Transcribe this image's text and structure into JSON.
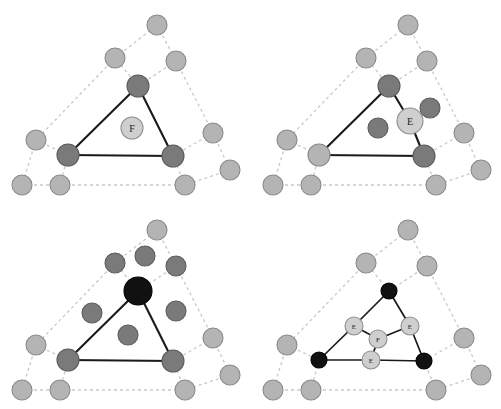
{
  "figure": {
    "width": 501,
    "height": 409,
    "background": "#ffffff"
  },
  "colors": {
    "node_light": "#b4b4b4",
    "node_mid": "#8d8d8d",
    "node_dark": "#7a7a7a",
    "node_black": "#111111",
    "node_label_fill": "#cfcfcf",
    "edge_solid": "#1a1a1a",
    "edge_dashed": "#c9c9c9"
  },
  "labels": {
    "face_point": "F",
    "edge_point": "E"
  },
  "panels": [
    {
      "id": "panel-top-left",
      "name": "face-point-panel",
      "origin": {
        "x": 0,
        "y": 0
      },
      "size": {
        "w": 250,
        "h": 205
      },
      "caption": "",
      "dashed_edges": [
        [
          115,
          58,
          157,
          25
        ],
        [
          157,
          25,
          176,
          61
        ],
        [
          176,
          61,
          138,
          86
        ],
        [
          138,
          86,
          115,
          58
        ],
        [
          115,
          58,
          36,
          140
        ],
        [
          36,
          140,
          22,
          185
        ],
        [
          36,
          140,
          68,
          155
        ],
        [
          68,
          155,
          60,
          185
        ],
        [
          22,
          185,
          60,
          185
        ],
        [
          60,
          185,
          185,
          185
        ],
        [
          185,
          185,
          173,
          156
        ],
        [
          173,
          156,
          213,
          133
        ],
        [
          213,
          133,
          176,
          61
        ],
        [
          213,
          133,
          230,
          170
        ],
        [
          230,
          170,
          185,
          185
        ]
      ],
      "solid_edges": [
        [
          138,
          86,
          68,
          155
        ],
        [
          68,
          155,
          173,
          156
        ],
        [
          173,
          156,
          138,
          86
        ]
      ],
      "nodes": [
        {
          "x": 157,
          "y": 25,
          "r": 10,
          "tone": "light",
          "label": ""
        },
        {
          "x": 115,
          "y": 58,
          "r": 10,
          "tone": "light",
          "label": ""
        },
        {
          "x": 176,
          "y": 61,
          "r": 10,
          "tone": "light",
          "label": ""
        },
        {
          "x": 138,
          "y": 86,
          "r": 11,
          "tone": "dark",
          "label": ""
        },
        {
          "x": 36,
          "y": 140,
          "r": 10,
          "tone": "light",
          "label": ""
        },
        {
          "x": 213,
          "y": 133,
          "r": 10,
          "tone": "light",
          "label": ""
        },
        {
          "x": 68,
          "y": 155,
          "r": 11,
          "tone": "dark",
          "label": ""
        },
        {
          "x": 173,
          "y": 156,
          "r": 11,
          "tone": "dark",
          "label": ""
        },
        {
          "x": 230,
          "y": 170,
          "r": 10,
          "tone": "light",
          "label": ""
        },
        {
          "x": 22,
          "y": 185,
          "r": 10,
          "tone": "light",
          "label": ""
        },
        {
          "x": 60,
          "y": 185,
          "r": 10,
          "tone": "light",
          "label": ""
        },
        {
          "x": 185,
          "y": 185,
          "r": 10,
          "tone": "light",
          "label": ""
        }
      ],
      "label_nodes": [
        {
          "x": 132,
          "y": 128,
          "r": 11,
          "label": "F",
          "size": "big"
        }
      ]
    },
    {
      "id": "panel-top-right",
      "name": "edge-point-panel",
      "origin": {
        "x": 251,
        "y": 0
      },
      "size": {
        "w": 250,
        "h": 205
      },
      "caption": "",
      "dashed_edges": [
        [
          115,
          58,
          157,
          25
        ],
        [
          157,
          25,
          176,
          61
        ],
        [
          176,
          61,
          138,
          86
        ],
        [
          138,
          86,
          115,
          58
        ],
        [
          115,
          58,
          36,
          140
        ],
        [
          36,
          140,
          22,
          185
        ],
        [
          36,
          140,
          68,
          155
        ],
        [
          68,
          155,
          60,
          185
        ],
        [
          22,
          185,
          60,
          185
        ],
        [
          60,
          185,
          185,
          185
        ],
        [
          185,
          185,
          173,
          156
        ],
        [
          173,
          156,
          213,
          133
        ],
        [
          213,
          133,
          176,
          61
        ],
        [
          213,
          133,
          230,
          170
        ],
        [
          230,
          170,
          185,
          185
        ]
      ],
      "solid_edges": [
        [
          138,
          86,
          68,
          155
        ],
        [
          68,
          155,
          173,
          156
        ],
        [
          138,
          86,
          159,
          121
        ],
        [
          159,
          121,
          173,
          156
        ]
      ],
      "nodes": [
        {
          "x": 157,
          "y": 25,
          "r": 10,
          "tone": "light",
          "label": ""
        },
        {
          "x": 115,
          "y": 58,
          "r": 10,
          "tone": "light",
          "label": ""
        },
        {
          "x": 176,
          "y": 61,
          "r": 10,
          "tone": "light",
          "label": ""
        },
        {
          "x": 138,
          "y": 86,
          "r": 11,
          "tone": "dark",
          "label": ""
        },
        {
          "x": 36,
          "y": 140,
          "r": 10,
          "tone": "light",
          "label": ""
        },
        {
          "x": 213,
          "y": 133,
          "r": 10,
          "tone": "light",
          "label": ""
        },
        {
          "x": 179,
          "y": 108,
          "r": 10,
          "tone": "dark",
          "label": ""
        },
        {
          "x": 127,
          "y": 128,
          "r": 10,
          "tone": "dark",
          "label": ""
        },
        {
          "x": 68,
          "y": 155,
          "r": 11,
          "tone": "light",
          "label": ""
        },
        {
          "x": 173,
          "y": 156,
          "r": 11,
          "tone": "dark",
          "label": ""
        },
        {
          "x": 230,
          "y": 170,
          "r": 10,
          "tone": "light",
          "label": ""
        },
        {
          "x": 22,
          "y": 185,
          "r": 10,
          "tone": "light",
          "label": ""
        },
        {
          "x": 60,
          "y": 185,
          "r": 10,
          "tone": "light",
          "label": ""
        },
        {
          "x": 185,
          "y": 185,
          "r": 10,
          "tone": "light",
          "label": ""
        }
      ],
      "label_nodes": [
        {
          "x": 159,
          "y": 121,
          "r": 13,
          "label": "E",
          "size": "big"
        }
      ]
    },
    {
      "id": "panel-bottom-left",
      "name": "vertex-point-panel",
      "origin": {
        "x": 0,
        "y": 205
      },
      "size": {
        "w": 250,
        "h": 204
      },
      "caption": "",
      "dashed_edges": [
        [
          115,
          58,
          157,
          25
        ],
        [
          157,
          25,
          176,
          61
        ],
        [
          176,
          61,
          138,
          86
        ],
        [
          138,
          86,
          115,
          58
        ],
        [
          115,
          58,
          36,
          140
        ],
        [
          36,
          140,
          22,
          185
        ],
        [
          36,
          140,
          68,
          155
        ],
        [
          68,
          155,
          60,
          185
        ],
        [
          22,
          185,
          60,
          185
        ],
        [
          60,
          185,
          185,
          185
        ],
        [
          185,
          185,
          173,
          156
        ],
        [
          173,
          156,
          213,
          133
        ],
        [
          213,
          133,
          176,
          61
        ],
        [
          213,
          133,
          230,
          170
        ],
        [
          230,
          170,
          185,
          185
        ]
      ],
      "solid_edges": [
        [
          138,
          86,
          68,
          155
        ],
        [
          68,
          155,
          173,
          156
        ],
        [
          173,
          156,
          138,
          86
        ]
      ],
      "nodes": [
        {
          "x": 157,
          "y": 25,
          "r": 10,
          "tone": "light",
          "label": ""
        },
        {
          "x": 115,
          "y": 58,
          "r": 10,
          "tone": "dark",
          "label": ""
        },
        {
          "x": 145,
          "y": 51,
          "r": 10,
          "tone": "dark",
          "label": ""
        },
        {
          "x": 176,
          "y": 61,
          "r": 10,
          "tone": "dark",
          "label": ""
        },
        {
          "x": 138,
          "y": 86,
          "r": 14,
          "tone": "black",
          "label": ""
        },
        {
          "x": 36,
          "y": 140,
          "r": 10,
          "tone": "light",
          "label": ""
        },
        {
          "x": 92,
          "y": 108,
          "r": 10,
          "tone": "dark",
          "label": ""
        },
        {
          "x": 176,
          "y": 106,
          "r": 10,
          "tone": "dark",
          "label": ""
        },
        {
          "x": 128,
          "y": 130,
          "r": 10,
          "tone": "dark",
          "label": ""
        },
        {
          "x": 213,
          "y": 133,
          "r": 10,
          "tone": "light",
          "label": ""
        },
        {
          "x": 68,
          "y": 155,
          "r": 11,
          "tone": "dark",
          "label": ""
        },
        {
          "x": 173,
          "y": 156,
          "r": 11,
          "tone": "dark",
          "label": ""
        },
        {
          "x": 230,
          "y": 170,
          "r": 10,
          "tone": "light",
          "label": ""
        },
        {
          "x": 22,
          "y": 185,
          "r": 10,
          "tone": "light",
          "label": ""
        },
        {
          "x": 60,
          "y": 185,
          "r": 10,
          "tone": "light",
          "label": ""
        },
        {
          "x": 185,
          "y": 185,
          "r": 10,
          "tone": "light",
          "label": ""
        }
      ],
      "label_nodes": []
    },
    {
      "id": "panel-bottom-right",
      "name": "subdivided-mesh-panel",
      "origin": {
        "x": 251,
        "y": 205
      },
      "size": {
        "w": 250,
        "h": 204
      },
      "caption": "",
      "dashed_edges": [
        [
          115,
          58,
          157,
          25
        ],
        [
          157,
          25,
          176,
          61
        ],
        [
          176,
          61,
          138,
          86
        ],
        [
          138,
          86,
          115,
          58
        ],
        [
          115,
          58,
          36,
          140
        ],
        [
          36,
          140,
          22,
          185
        ],
        [
          36,
          140,
          68,
          155
        ],
        [
          68,
          155,
          60,
          185
        ],
        [
          22,
          185,
          60,
          185
        ],
        [
          60,
          185,
          185,
          185
        ],
        [
          185,
          185,
          173,
          156
        ],
        [
          173,
          156,
          213,
          133
        ],
        [
          213,
          133,
          176,
          61
        ],
        [
          213,
          133,
          230,
          170
        ],
        [
          230,
          170,
          185,
          185
        ]
      ],
      "solid_edges": [
        [
          138,
          86,
          103,
          121
        ],
        [
          103,
          121,
          68,
          155
        ],
        [
          68,
          155,
          120,
          155
        ],
        [
          120,
          155,
          173,
          156
        ],
        [
          173,
          156,
          159,
          121
        ],
        [
          159,
          121,
          138,
          86
        ],
        [
          103,
          121,
          127,
          134
        ],
        [
          127,
          134,
          159,
          121
        ],
        [
          127,
          134,
          120,
          155
        ]
      ],
      "nodes": [
        {
          "x": 157,
          "y": 25,
          "r": 10,
          "tone": "light",
          "label": ""
        },
        {
          "x": 115,
          "y": 58,
          "r": 10,
          "tone": "light",
          "label": ""
        },
        {
          "x": 176,
          "y": 61,
          "r": 10,
          "tone": "light",
          "label": ""
        },
        {
          "x": 138,
          "y": 86,
          "r": 8,
          "tone": "black",
          "label": ""
        },
        {
          "x": 36,
          "y": 140,
          "r": 10,
          "tone": "light",
          "label": ""
        },
        {
          "x": 213,
          "y": 133,
          "r": 10,
          "tone": "light",
          "label": ""
        },
        {
          "x": 68,
          "y": 155,
          "r": 8,
          "tone": "black",
          "label": ""
        },
        {
          "x": 173,
          "y": 156,
          "r": 8,
          "tone": "black",
          "label": ""
        },
        {
          "x": 230,
          "y": 170,
          "r": 10,
          "tone": "light",
          "label": ""
        },
        {
          "x": 22,
          "y": 185,
          "r": 10,
          "tone": "light",
          "label": ""
        },
        {
          "x": 60,
          "y": 185,
          "r": 10,
          "tone": "light",
          "label": ""
        },
        {
          "x": 185,
          "y": 185,
          "r": 10,
          "tone": "light",
          "label": ""
        }
      ],
      "label_nodes": [
        {
          "x": 103,
          "y": 121,
          "r": 9,
          "label": "E",
          "size": "small"
        },
        {
          "x": 159,
          "y": 121,
          "r": 9,
          "label": "E",
          "size": "small"
        },
        {
          "x": 120,
          "y": 155,
          "r": 9,
          "label": "E",
          "size": "small"
        },
        {
          "x": 127,
          "y": 134,
          "r": 9,
          "label": "F",
          "size": "small"
        }
      ]
    }
  ]
}
